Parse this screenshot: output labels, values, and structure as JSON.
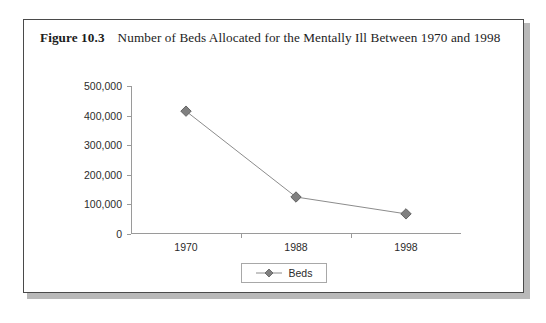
{
  "figure": {
    "number_label": "Figure 10.3",
    "caption": "Number of Beds Allocated for the Mentally Ill Between 1970 and 1998"
  },
  "legend": {
    "position": "bottom-center",
    "entries": [
      {
        "label": "Beds",
        "marker": "diamond-marker",
        "color": "#808080"
      }
    ]
  },
  "colors": {
    "series_line": "#8c8c8c",
    "series_marker_fill": "#808080",
    "series_marker_stroke": "#5a5a5a",
    "axis": "#9a9a9a",
    "frame_border": "#4a4a4a",
    "text": "#2b2b2b"
  },
  "chart_data": {
    "type": "line",
    "title": "Number of Beds Allocated for the Mentally Ill Between 1970 and 1998",
    "xlabel": "",
    "ylabel": "",
    "categories": [
      "1970",
      "1988",
      "1998"
    ],
    "series": [
      {
        "name": "Beds",
        "values": [
          415000,
          125000,
          68000
        ]
      }
    ],
    "ylim": [
      0,
      500000
    ],
    "yticks": [
      0,
      100000,
      200000,
      300000,
      400000,
      500000
    ],
    "ytick_labels": [
      "0",
      "100,000",
      "200,000",
      "300,000",
      "400,000",
      "500,000"
    ],
    "grid": false,
    "legend": "bottom-center"
  }
}
